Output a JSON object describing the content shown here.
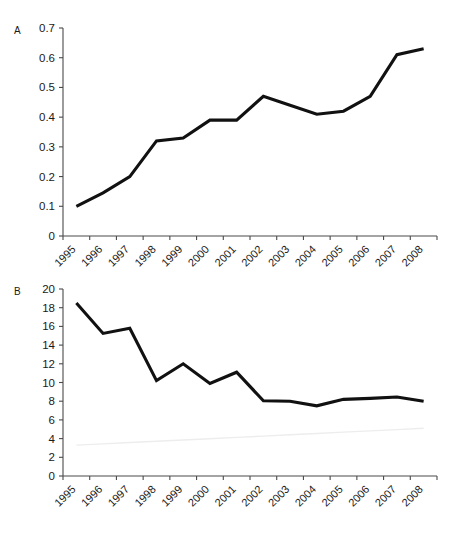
{
  "figure": {
    "background_color": "#ffffff",
    "line_color": "#111111",
    "axis_color": "#4a4a4a",
    "trend_line_color": "#ededed"
  },
  "panels": [
    {
      "letter": "A"
    },
    {
      "letter": "B"
    }
  ],
  "chart_data": [
    {
      "type": "line",
      "panel": "A",
      "title": "",
      "xlabel": "",
      "ylabel": "",
      "categories": [
        "1995",
        "1996",
        "1997",
        "1998",
        "1999",
        "2000",
        "2001",
        "2002",
        "2003",
        "2004",
        "2005",
        "2006",
        "2007",
        "2008"
      ],
      "values": [
        0.1,
        0.145,
        0.2,
        0.32,
        0.33,
        0.39,
        0.39,
        0.47,
        0.44,
        0.41,
        0.42,
        0.47,
        0.61,
        0.63
      ],
      "ylim": [
        0,
        0.7
      ],
      "yticks": [
        0,
        0.1,
        0.2,
        0.3,
        0.4,
        0.5,
        0.6,
        0.7
      ],
      "ytick_labels": [
        "0",
        "0.1",
        "0.2",
        "0.3",
        "0.4",
        "0.5",
        "0.6",
        "0.7"
      ],
      "grid": false,
      "legend": "none",
      "xtick_rotation_deg": 45
    },
    {
      "type": "line",
      "panel": "B",
      "title": "",
      "xlabel": "",
      "ylabel": "",
      "categories": [
        "1995",
        "1996",
        "1997",
        "1998",
        "1999",
        "2000",
        "2001",
        "2002",
        "2003",
        "2004",
        "2005",
        "2006",
        "2007",
        "2008"
      ],
      "values": [
        18.5,
        15.25,
        15.8,
        10.2,
        12.0,
        9.9,
        11.1,
        8.05,
        8.0,
        7.5,
        8.2,
        8.3,
        8.45,
        8.0
      ],
      "series": [
        {
          "name": "main",
          "values": [
            18.5,
            15.25,
            15.8,
            10.2,
            12.0,
            9.9,
            11.1,
            8.05,
            8.0,
            7.5,
            8.2,
            8.3,
            8.45,
            8.0
          ]
        },
        {
          "name": "trend",
          "values": [
            3.3,
            3.44,
            3.58,
            3.72,
            3.85,
            3.99,
            4.13,
            4.27,
            4.41,
            4.55,
            4.69,
            4.83,
            4.96,
            5.1
          ]
        }
      ],
      "ylim": [
        0,
        20
      ],
      "yticks": [
        0,
        2,
        4,
        6,
        8,
        10,
        12,
        14,
        16,
        18,
        20
      ],
      "ytick_labels": [
        "0",
        "2",
        "4",
        "6",
        "8",
        "10",
        "12",
        "14",
        "16",
        "18",
        "20"
      ],
      "grid": false,
      "legend": "none",
      "xtick_rotation_deg": 45
    }
  ]
}
